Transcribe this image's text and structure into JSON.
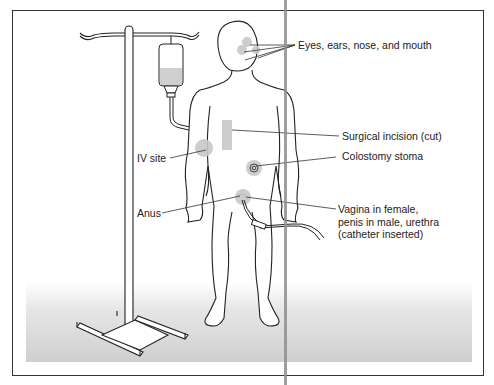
{
  "figure": {
    "illustration": {
      "subject": "standing-human-figure",
      "equipment": [
        "iv-pole",
        "iv-bag",
        "urinary-catheter"
      ]
    },
    "labels": [
      {
        "id": "eyes",
        "text": "Eyes, ears, nose, and mouth"
      },
      {
        "id": "incision",
        "text": "Surgical incision (cut)"
      },
      {
        "id": "iv",
        "text": "IV site"
      },
      {
        "id": "stoma",
        "text": "Colostomy stoma"
      },
      {
        "id": "anus",
        "text": "Anus"
      },
      {
        "id": "urethra",
        "text": "Vagina in female, penis in male, urethra (catheter inserted)",
        "lines": [
          "Vagina in female,",
          "penis in male, urethra",
          "(catheter inserted)"
        ]
      }
    ],
    "colors": {
      "line": "#222222",
      "highlight": "#c8c8c8",
      "frame": "#333333",
      "gutter": "#8e8e8e"
    }
  }
}
